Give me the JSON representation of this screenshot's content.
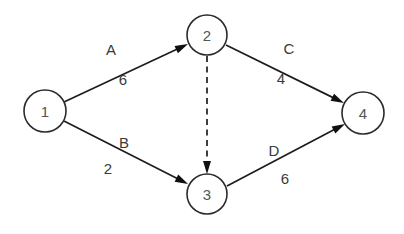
{
  "diagram": {
    "type": "activity-on-arrow-network",
    "background_color": "#ffffff",
    "line_color": "#1d1d1d",
    "node_stroke_color": "#2b2b2b",
    "node_fill_color": "#ffffff",
    "node_label_color": "#555555",
    "edge_label_color": "#3a3a3a",
    "nodes": [
      {
        "id": "n1",
        "label": "1",
        "cx": 45,
        "cy": 111,
        "r": 21
      },
      {
        "id": "n2",
        "label": "2",
        "cx": 207,
        "cy": 35,
        "r": 20
      },
      {
        "id": "n3",
        "label": "3",
        "cx": 207,
        "cy": 194,
        "r": 20
      },
      {
        "id": "n4",
        "label": "4",
        "cx": 363,
        "cy": 113,
        "r": 21
      }
    ],
    "edges": [
      {
        "id": "e-a",
        "name": "A",
        "duration": "6",
        "from": "1",
        "to": "2",
        "style": "solid",
        "arrow": true,
        "x1": 64,
        "y1": 102,
        "x2": 188,
        "y2": 44,
        "name_x": 111,
        "name_y": 49,
        "duration_x": 123,
        "duration_y": 79
      },
      {
        "id": "e-c",
        "name": "C",
        "duration": "4",
        "from": "2",
        "to": "4",
        "style": "solid",
        "arrow": true,
        "x1": 226,
        "y1": 45,
        "x2": 344,
        "y2": 103,
        "name_x": 289,
        "name_y": 48,
        "duration_x": 281,
        "duration_y": 78
      },
      {
        "id": "e-b",
        "name": "B",
        "duration": "2",
        "from": "1",
        "to": "3",
        "style": "solid",
        "arrow": true,
        "x1": 64,
        "y1": 121,
        "x2": 188,
        "y2": 184,
        "name_x": 124,
        "name_y": 142,
        "duration_x": 108,
        "duration_y": 168
      },
      {
        "id": "e-d",
        "name": "D",
        "duration": "6",
        "from": "3",
        "to": "4",
        "style": "solid",
        "arrow": true,
        "x1": 227,
        "y1": 186,
        "x2": 345,
        "y2": 124,
        "name_x": 274,
        "name_y": 150,
        "duration_x": 285,
        "duration_y": 178
      },
      {
        "id": "e-dummy",
        "name": "",
        "duration": "",
        "from": "2",
        "to": "3",
        "style": "dashed",
        "arrow": true,
        "x1": 207,
        "y1": 56,
        "x2": 207,
        "y2": 174,
        "name_x": 0,
        "name_y": 0,
        "duration_x": 0,
        "duration_y": 0
      }
    ]
  }
}
